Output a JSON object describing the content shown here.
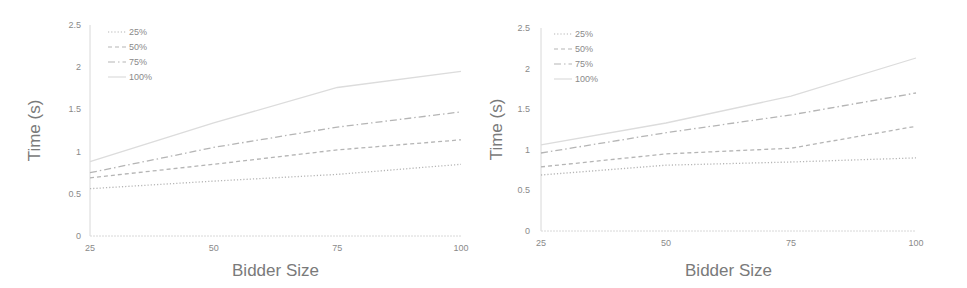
{
  "chart_data": [
    {
      "type": "line",
      "title": "",
      "xlabel": "Bidder Size",
      "ylabel": "Time (s)",
      "x": [
        25,
        50,
        75,
        100
      ],
      "xticks": [
        "25",
        "50",
        "75",
        "100"
      ],
      "yticks": [
        "0",
        "0.5",
        "1",
        "1.5",
        "2",
        "2.5"
      ],
      "ylim": [
        0,
        2.5
      ],
      "grid": false,
      "legend_position": "upper-left",
      "series": [
        {
          "name": "25%",
          "style": "dotted",
          "values": [
            0.56,
            0.65,
            0.73,
            0.85
          ]
        },
        {
          "name": "50%",
          "style": "dashed",
          "values": [
            0.69,
            0.85,
            1.02,
            1.14
          ]
        },
        {
          "name": "75%",
          "style": "dash-dot",
          "values": [
            0.75,
            1.05,
            1.29,
            1.47
          ]
        },
        {
          "name": "100%",
          "style": "solid-light",
          "values": [
            0.88,
            1.34,
            1.76,
            1.95
          ]
        }
      ]
    },
    {
      "type": "line",
      "title": "",
      "xlabel": "Bidder Size",
      "ylabel": "Time (s)",
      "x": [
        25,
        50,
        75,
        100
      ],
      "xticks": [
        "25",
        "50",
        "75",
        "100"
      ],
      "yticks": [
        "0",
        "0.5",
        "1",
        "1.5",
        "2",
        "2.5"
      ],
      "ylim": [
        0,
        2.5
      ],
      "grid": false,
      "legend_position": "upper-left",
      "series": [
        {
          "name": "25%",
          "style": "dotted",
          "values": [
            0.69,
            0.81,
            0.85,
            0.9
          ]
        },
        {
          "name": "50%",
          "style": "dashed",
          "values": [
            0.79,
            0.95,
            1.02,
            1.29
          ]
        },
        {
          "name": "75%",
          "style": "dash-dot",
          "values": [
            0.96,
            1.21,
            1.43,
            1.7
          ]
        },
        {
          "name": "100%",
          "style": "solid-light",
          "values": [
            1.06,
            1.33,
            1.66,
            2.13
          ]
        }
      ]
    }
  ],
  "colors": {
    "line": "#b5b5b5",
    "light_line": "#dcdcdc",
    "axis": "#d8d8d8",
    "text": "#7a7a7a"
  }
}
